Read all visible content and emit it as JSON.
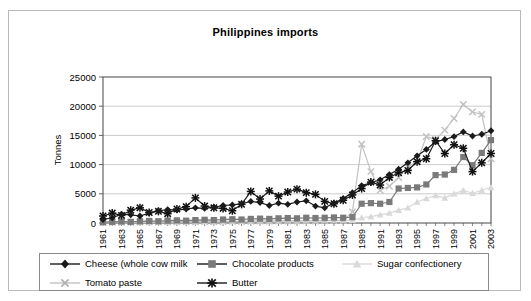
{
  "chart_data": {
    "type": "line",
    "title": "Philippines imports",
    "xlabel": "",
    "ylabel": "Tonnes",
    "ylim": [
      0,
      25000
    ],
    "ytick_values": [
      0,
      5000,
      10000,
      15000,
      20000,
      25000
    ],
    "ytick_labels": [
      "0",
      "5000",
      "10000",
      "15000",
      "20000",
      "25000"
    ],
    "grid": true,
    "legend_position": "bottom",
    "x": [
      1961,
      1962,
      1963,
      1964,
      1965,
      1966,
      1967,
      1968,
      1969,
      1970,
      1971,
      1972,
      1973,
      1974,
      1975,
      1976,
      1977,
      1978,
      1979,
      1980,
      1981,
      1982,
      1983,
      1984,
      1985,
      1986,
      1987,
      1988,
      1989,
      1990,
      1991,
      1992,
      1993,
      1994,
      1995,
      1996,
      1997,
      1998,
      1999,
      2000,
      2001,
      2002,
      2003
    ],
    "xtick_labels": [
      "1961",
      "1963",
      "1965",
      "1967",
      "1969",
      "1971",
      "1973",
      "1975",
      "1977",
      "1979",
      "1981",
      "1983",
      "1985",
      "1987",
      "1989",
      "1991",
      "1993",
      "1995",
      "1997",
      "1999",
      "2001",
      "2003"
    ],
    "series": [
      {
        "name": "Cheese (whole cow milk",
        "marker": "diamond",
        "color": "#1a1a1a",
        "values": [
          600,
          900,
          1500,
          1400,
          1200,
          1700,
          2100,
          2300,
          2200,
          2400,
          2600,
          2500,
          2700,
          3000,
          3100,
          3300,
          3700,
          3500,
          3000,
          3400,
          3200,
          3600,
          3800,
          2900,
          2600,
          3400,
          4200,
          5200,
          6400,
          6900,
          7400,
          8300,
          9200,
          10300,
          11500,
          12600,
          13900,
          14300,
          14800,
          15600,
          14900,
          15200,
          15800
        ]
      },
      {
        "name": "Chocolate products",
        "marker": "square",
        "color": "#7a7a7a",
        "values": [
          150,
          200,
          250,
          200,
          300,
          350,
          300,
          400,
          450,
          400,
          500,
          550,
          500,
          600,
          650,
          600,
          700,
          750,
          700,
          800,
          850,
          800,
          900,
          850,
          900,
          950,
          900,
          1000,
          3300,
          3400,
          3300,
          3600,
          5900,
          6000,
          6100,
          6600,
          8200,
          8300,
          9100,
          11300,
          9900,
          12000,
          14200
        ]
      },
      {
        "name": "Sugar confectionery",
        "marker": "triangle",
        "color": "#d9d9d9",
        "values": [
          100,
          120,
          150,
          130,
          160,
          180,
          170,
          200,
          220,
          210,
          240,
          260,
          250,
          280,
          300,
          290,
          320,
          340,
          330,
          360,
          380,
          370,
          400,
          380,
          420,
          450,
          430,
          500,
          900,
          1100,
          1400,
          1700,
          2200,
          2600,
          3600,
          4200,
          4700,
          4300,
          5000,
          5600,
          5100,
          5600,
          6100
        ]
      },
      {
        "name": "Tomato paste",
        "marker": "x",
        "color": "#c2c2c2",
        "values": [
          80,
          100,
          130,
          110,
          140,
          160,
          150,
          180,
          200,
          190,
          220,
          240,
          230,
          260,
          280,
          270,
          300,
          320,
          310,
          340,
          360,
          350,
          380,
          360,
          400,
          430,
          420,
          1900,
          13500,
          8800,
          5600,
          6300,
          7800,
          9600,
          10500,
          14800,
          14300,
          15900,
          17900,
          20300,
          19000,
          18600,
          11000
        ]
      },
      {
        "name": "Butter",
        "marker": "star",
        "color": "#1a1a1a",
        "values": [
          1200,
          1700,
          1300,
          2200,
          2600,
          1800,
          2000,
          1600,
          2400,
          2800,
          4300,
          2900,
          2600,
          2500,
          2100,
          3200,
          5400,
          4100,
          5500,
          4600,
          5300,
          5800,
          5200,
          4900,
          3700,
          3300,
          3900,
          4800,
          5900,
          7000,
          6500,
          7800,
          8600,
          9000,
          10500,
          11000,
          14100,
          11900,
          13400,
          12800,
          8800,
          10300,
          11900
        ]
      }
    ]
  },
  "legend": {
    "items": [
      {
        "label": "Cheese (whole cow milk"
      },
      {
        "label": "Chocolate products"
      },
      {
        "label": "Sugar confectionery"
      },
      {
        "label": "Tomato paste"
      },
      {
        "label": "Butter"
      }
    ]
  }
}
